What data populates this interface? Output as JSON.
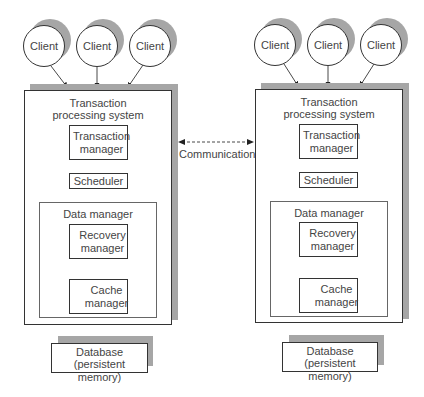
{
  "diagram": {
    "systems": [
      {
        "id": "left",
        "clients": [
          "Client",
          "Client",
          "Client"
        ],
        "title_line1": "Transaction",
        "title_line2": "processing system",
        "transaction_manager": "Transaction manager",
        "scheduler": "Scheduler",
        "data_manager": {
          "title": "Data manager",
          "recovery_manager": "Recovery manager",
          "cache_manager": "Cache manager"
        },
        "database_line1": "Database",
        "database_line2": "(persistent memory)"
      },
      {
        "id": "right",
        "clients": [
          "Client",
          "Client",
          "Client"
        ],
        "title_line1": "Transaction",
        "title_line2": "processing system",
        "transaction_manager": "Transaction manager",
        "scheduler": "Scheduler",
        "data_manager": {
          "title": "Data manager",
          "recovery_manager": "Recovery manager",
          "cache_manager": "Cache manager"
        },
        "database_line1": "Database",
        "database_line2": "(persistent memory)"
      }
    ],
    "communication_label": "Communication",
    "colors": {
      "shadow": "#a6a6a6",
      "border": "#333333",
      "text": "#444444"
    }
  }
}
